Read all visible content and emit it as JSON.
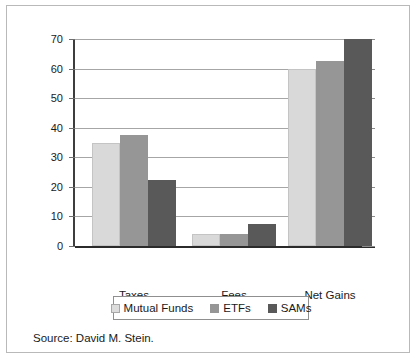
{
  "chart_data": {
    "type": "bar",
    "title": "",
    "subtitle": "",
    "xlabel": "",
    "ylabel": "",
    "categories": [
      "Taxes",
      "Fees",
      "Net Gains"
    ],
    "series": [
      {
        "name": "Mutual Funds",
        "color": "#d9d9d9",
        "values": [
          35,
          4,
          60
        ]
      },
      {
        "name": "ETFs",
        "color": "#969696",
        "values": [
          37.5,
          4,
          62.5
        ]
      },
      {
        "name": "SAMs",
        "color": "#595959",
        "values": [
          22.3,
          7.5,
          70
        ]
      }
    ],
    "ylim": [
      0,
      70
    ],
    "ytick_step": 10,
    "yticks": [
      0,
      10,
      20,
      30,
      40,
      50,
      60,
      70
    ],
    "ytick_labels": [
      "0",
      "10",
      "20",
      "30",
      "40",
      "50",
      "60",
      "70"
    ],
    "grid": true,
    "grid_axis": "y",
    "legend_position": "bottom-center",
    "legend_boxed": true
  },
  "source": {
    "text": "Source: David M. Stein."
  },
  "colors": {
    "series_light": "#d9d9d9",
    "series_medium": "#969696",
    "series_dark": "#595959",
    "gridline": "#a6a6a6",
    "axis": "#2b2b2b",
    "frame": "#b9b9b9",
    "text": "#1a1a1a"
  }
}
